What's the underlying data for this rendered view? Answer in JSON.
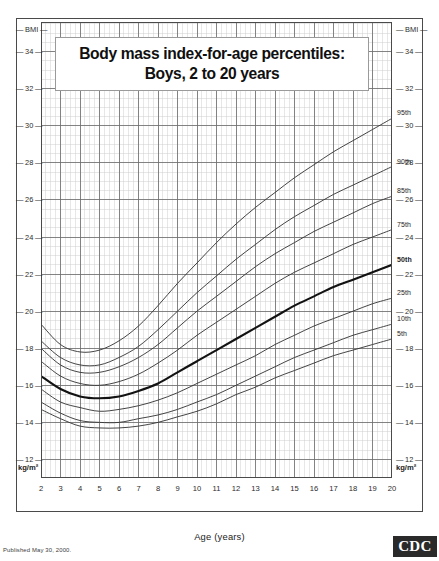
{
  "document": {
    "title_line1": "Body mass index-for-age percentiles:",
    "title_line2": "Boys, 2 to 20 years",
    "published": "Published May 30, 2000.",
    "logo_text": "CDC"
  },
  "axes": {
    "y_axis_header": "BMI",
    "y_axis_unit": "kg/m²",
    "x_axis_title": "Age (years)",
    "y_ticks": [
      34,
      32,
      30,
      28,
      26,
      24,
      22,
      20,
      18,
      16,
      14,
      12
    ],
    "x_ticks": [
      2,
      3,
      4,
      5,
      6,
      7,
      8,
      9,
      10,
      11,
      12,
      13,
      14,
      15,
      16,
      17,
      18,
      19,
      20
    ],
    "ylim": [
      11.0,
      35.6
    ],
    "xlim": [
      2,
      20
    ],
    "grid": "major and minor"
  },
  "colors": {
    "frame": "#4a4a4a",
    "grid_major": "#6d6d6d",
    "grid_minor": "#c9c9c9",
    "curve": "#3a3a3a",
    "curve_median": "#121212",
    "logo_bg": "#2a2a2a",
    "text": "#1a1a1a"
  },
  "chart_data": {
    "type": "line",
    "title": "Body mass index-for-age percentiles: Boys, 2 to 20 years",
    "xlabel": "Age (years)",
    "ylabel": "BMI",
    "ylim": [
      11.0,
      35.6
    ],
    "xlim": [
      2,
      20
    ],
    "legend": "curve end labels at right",
    "x": [
      2,
      3,
      4,
      5,
      6,
      7,
      8,
      9,
      10,
      11,
      12,
      13,
      14,
      15,
      16,
      17,
      18,
      19,
      20
    ],
    "series": [
      {
        "name": "95th",
        "label": "95th",
        "values": [
          19.3,
          18.2,
          17.8,
          17.9,
          18.4,
          19.2,
          20.3,
          21.5,
          22.6,
          23.7,
          24.7,
          25.6,
          26.4,
          27.2,
          27.9,
          28.6,
          29.2,
          29.8,
          30.4
        ],
        "bold": false
      },
      {
        "name": "90th",
        "label": "90th",
        "values": [
          18.4,
          17.5,
          17.1,
          17.1,
          17.5,
          18.1,
          19.0,
          20.0,
          21.0,
          21.9,
          22.8,
          23.6,
          24.4,
          25.1,
          25.7,
          26.3,
          26.8,
          27.3,
          27.8
        ],
        "bold": false
      },
      {
        "name": "85th",
        "label": "85th",
        "values": [
          18.0,
          17.1,
          16.7,
          16.7,
          17.0,
          17.5,
          18.2,
          19.1,
          20.0,
          20.8,
          21.6,
          22.4,
          23.1,
          23.7,
          24.3,
          24.8,
          25.3,
          25.8,
          26.2
        ],
        "bold": false
      },
      {
        "name": "75th",
        "label": "75th",
        "values": [
          17.3,
          16.5,
          16.1,
          16.0,
          16.2,
          16.6,
          17.2,
          17.9,
          18.7,
          19.4,
          20.1,
          20.8,
          21.5,
          22.1,
          22.6,
          23.1,
          23.6,
          24.0,
          24.4
        ],
        "bold": false
      },
      {
        "name": "50th",
        "label": "50th",
        "values": [
          16.5,
          15.8,
          15.4,
          15.3,
          15.4,
          15.7,
          16.1,
          16.7,
          17.3,
          17.9,
          18.5,
          19.1,
          19.7,
          20.3,
          20.8,
          21.3,
          21.7,
          22.1,
          22.5
        ],
        "bold": true
      },
      {
        "name": "25th",
        "label": "25th",
        "values": [
          15.8,
          15.1,
          14.8,
          14.6,
          14.7,
          14.9,
          15.2,
          15.6,
          16.1,
          16.6,
          17.1,
          17.6,
          18.2,
          18.7,
          19.2,
          19.6,
          20.0,
          20.4,
          20.7
        ],
        "bold": false
      },
      {
        "name": "10th",
        "label": "10th",
        "values": [
          15.1,
          14.5,
          14.1,
          14.0,
          14.0,
          14.2,
          14.4,
          14.7,
          15.1,
          15.5,
          16.0,
          16.5,
          17.0,
          17.5,
          17.9,
          18.3,
          18.7,
          19.0,
          19.3
        ],
        "bold": false
      },
      {
        "name": "5th",
        "label": "5th",
        "values": [
          14.7,
          14.2,
          13.8,
          13.7,
          13.7,
          13.8,
          14.0,
          14.3,
          14.6,
          15.0,
          15.5,
          15.9,
          16.4,
          16.8,
          17.2,
          17.6,
          17.9,
          18.2,
          18.5
        ],
        "bold": false
      }
    ]
  }
}
